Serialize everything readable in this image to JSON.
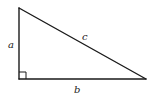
{
  "diagram": {
    "type": "right-triangle",
    "labels": {
      "a": "a",
      "b": "b",
      "c": "c"
    },
    "vertices": {
      "top": [
        19,
        8
      ],
      "right_angle": [
        19,
        79
      ],
      "right": [
        146,
        79
      ]
    },
    "right_angle_marker": true,
    "colors": {
      "stroke": "#1a1a1a",
      "background": "#ffffff"
    }
  }
}
